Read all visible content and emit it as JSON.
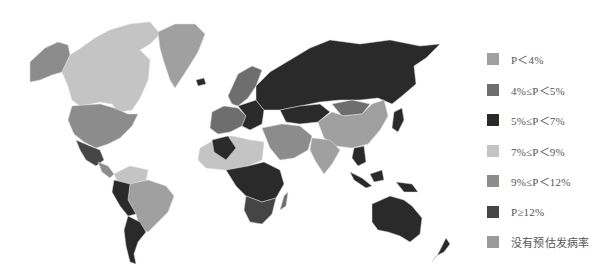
{
  "map": {
    "type": "choropleth",
    "subject": "world map of estimated prevalence P by country (grayscale)"
  },
  "legend": {
    "items": [
      {
        "label": "P＜4%",
        "color": "#a0a0a0"
      },
      {
        "label": "4%≤P＜5%",
        "color": "#6e6e6e"
      },
      {
        "label": "5%≤P＜7%",
        "color": "#2a2a2a"
      },
      {
        "label": "7%≤P＜9%",
        "color": "#c4c4c4"
      },
      {
        "label": "9%≤P＜12%",
        "color": "#8c8c8c"
      },
      {
        "label": "P≥12%",
        "color": "#454545"
      },
      {
        "label": "没有预估发病率",
        "color": "#9a9a9a"
      }
    ]
  },
  "regions": {
    "alaska": "#8c8c8c",
    "canada": "#c4c4c4",
    "greenland": "#a0a0a0",
    "usa": "#8c8c8c",
    "mexico": "#454545",
    "central_america": "#8c8c8c",
    "colombia_venezuela": "#c4c4c4",
    "brazil": "#a0a0a0",
    "peru_bolivia": "#2a2a2a",
    "argentina_chile": "#2a2a2a",
    "russia": "#2a2a2a",
    "scandinavia": "#6e6e6e",
    "western_europe": "#6e6e6e",
    "eastern_europe": "#2a2a2a",
    "kazakhstan": "#2a2a2a",
    "china": "#a0a0a0",
    "mongolia": "#6e6e6e",
    "india": "#a0a0a0",
    "middle_east": "#8c8c8c",
    "north_africa": "#c4c4c4",
    "algeria": "#2a2a2a",
    "central_africa": "#2a2a2a",
    "southern_africa": "#454545",
    "madagascar": "#6e6e6e",
    "southeast_asia": "#2a2a2a",
    "japan": "#2a2a2a",
    "indonesia": "#2a2a2a",
    "australia": "#2a2a2a",
    "new_zealand": "#2a2a2a",
    "iceland": "#2a2a2a"
  }
}
